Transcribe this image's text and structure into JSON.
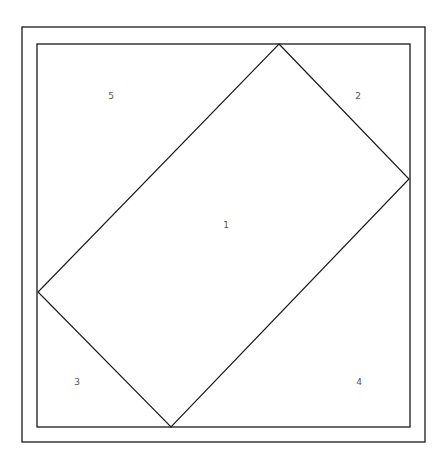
{
  "diagram": {
    "type": "quilt-block-layout",
    "stroke_color": "#1a1a1a",
    "label_color": "#555555",
    "outer_border": {
      "x": 22,
      "y": 27,
      "width": 403,
      "height": 415
    },
    "inner_border": {
      "x": 37,
      "y": 44,
      "width": 373,
      "height": 383
    },
    "center_piece": {
      "points": [
        [
          279,
          44
        ],
        [
          409,
          179
        ],
        [
          171,
          427
        ],
        [
          38,
          292
        ]
      ]
    },
    "regions": [
      {
        "id": "1",
        "label": "1",
        "x": 226,
        "y": 228
      },
      {
        "id": "2",
        "label": "2",
        "x": 358,
        "y": 99
      },
      {
        "id": "3",
        "label": "3",
        "x": 77,
        "y": 385
      },
      {
        "id": "4",
        "label": "4",
        "x": 359,
        "y": 385
      },
      {
        "id": "5",
        "label": "5",
        "x": 111,
        "y": 99
      }
    ]
  }
}
